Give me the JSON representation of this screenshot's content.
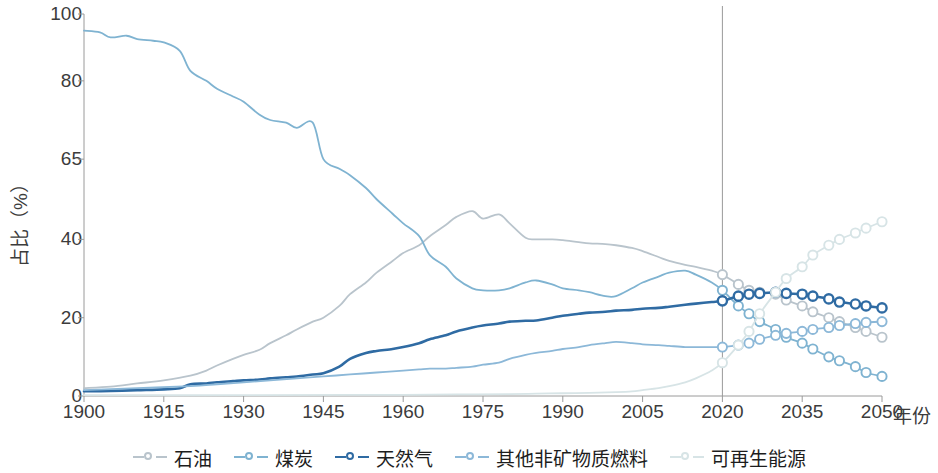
{
  "chart_data": {
    "type": "line",
    "title": "",
    "xlabel": "年份",
    "ylabel": "占比（%）",
    "xlim": [
      1900,
      2050
    ],
    "ylim": [
      0,
      100
    ],
    "grid": false,
    "legend_position": "bottom",
    "yticks": [
      0,
      20,
      40,
      65,
      80,
      100
    ],
    "ytick_positions_frac": [
      0.0,
      0.205,
      0.41,
      0.62,
      0.825,
      1.0
    ],
    "xticks": [
      1900,
      1915,
      1930,
      1945,
      1960,
      1975,
      1990,
      2005,
      2020,
      2035,
      2050
    ],
    "projection_divider_year": 2020,
    "colors": {
      "oil": "#b9c4cc",
      "coal": "#7fb3d1",
      "gas": "#2f6ba3",
      "other_nonfossil": "#8cb8d8",
      "renewables": "#d7e4e6",
      "axis": "#9a9a9a",
      "divider": "#9a9a9a",
      "text": "#3c3c3c"
    },
    "series": [
      {
        "name": "石油",
        "key": "oil",
        "color": "#b9c4cc",
        "markers_from_year": 2020,
        "x": [
          1900,
          1905,
          1910,
          1915,
          1920,
          1923,
          1925,
          1928,
          1930,
          1933,
          1935,
          1938,
          1940,
          1943,
          1945,
          1948,
          1950,
          1953,
          1955,
          1958,
          1960,
          1963,
          1965,
          1968,
          1970,
          1973,
          1975,
          1978,
          1980,
          1983,
          1985,
          1988,
          1990,
          1993,
          1995,
          1998,
          2000,
          2003,
          2005,
          2008,
          2010,
          2013,
          2015,
          2018,
          2020,
          2023,
          2025,
          2027,
          2030,
          2032,
          2035,
          2037,
          2040,
          2042,
          2045,
          2047,
          2050
        ],
        "y": [
          2.0,
          2.4,
          3.2,
          4.0,
          5.2,
          6.5,
          7.8,
          9.5,
          10.5,
          11.8,
          13.5,
          15.5,
          17.0,
          19.0,
          20.0,
          23.0,
          26.0,
          29.0,
          31.5,
          34.5,
          36.5,
          38.5,
          41.0,
          44.5,
          47.0,
          48.8,
          46.5,
          47.8,
          45.0,
          40.5,
          40.0,
          40.0,
          39.8,
          39.3,
          39.0,
          38.8,
          38.5,
          37.8,
          37.0,
          35.5,
          34.5,
          33.5,
          33.0,
          32.0,
          31.0,
          28.5,
          27.0,
          26.5,
          26.0,
          24.5,
          23.0,
          21.5,
          20.0,
          19.0,
          17.5,
          16.5,
          15.0
        ]
      },
      {
        "name": "煤炭",
        "key": "coal",
        "color": "#7fb3d1",
        "markers_from_year": 2020,
        "x": [
          1900,
          1903,
          1905,
          1908,
          1910,
          1913,
          1915,
          1918,
          1920,
          1923,
          1925,
          1928,
          1930,
          1933,
          1935,
          1938,
          1940,
          1943,
          1945,
          1948,
          1950,
          1953,
          1955,
          1958,
          1960,
          1963,
          1965,
          1968,
          1970,
          1973,
          1975,
          1978,
          1980,
          1983,
          1985,
          1988,
          1990,
          1993,
          1995,
          1998,
          2000,
          2003,
          2005,
          2008,
          2010,
          2013,
          2015,
          2018,
          2020,
          2023,
          2025,
          2027,
          2030,
          2032,
          2035,
          2037,
          2040,
          2042,
          2045,
          2047,
          2050
        ],
        "y": [
          95.0,
          94.5,
          93.0,
          93.5,
          92.5,
          92.0,
          91.5,
          89.0,
          83.0,
          80.0,
          78.5,
          77.0,
          76.0,
          73.5,
          72.5,
          72.0,
          71.0,
          72.0,
          65.0,
          62.0,
          60.0,
          56.0,
          52.5,
          48.0,
          45.0,
          41.0,
          36.0,
          33.0,
          30.0,
          27.5,
          27.0,
          27.0,
          27.5,
          29.0,
          29.5,
          28.5,
          27.5,
          27.0,
          26.5,
          25.5,
          25.5,
          27.5,
          29.0,
          30.5,
          31.5,
          32.0,
          31.0,
          29.0,
          27.0,
          23.0,
          21.0,
          19.0,
          17.0,
          15.0,
          13.5,
          12.0,
          10.0,
          9.0,
          7.5,
          6.0,
          5.0
        ]
      },
      {
        "name": "天然气",
        "key": "gas",
        "color": "#2f6ba3",
        "markers_from_year": 2020,
        "x": [
          1900,
          1905,
          1910,
          1915,
          1918,
          1920,
          1923,
          1925,
          1928,
          1930,
          1933,
          1935,
          1938,
          1940,
          1943,
          1945,
          1948,
          1950,
          1953,
          1955,
          1958,
          1960,
          1963,
          1965,
          1968,
          1970,
          1973,
          1975,
          1978,
          1980,
          1983,
          1985,
          1988,
          1990,
          1993,
          1995,
          1998,
          2000,
          2003,
          2005,
          2008,
          2010,
          2013,
          2015,
          2018,
          2020,
          2023,
          2025,
          2027,
          2030,
          2032,
          2035,
          2037,
          2040,
          2042,
          2045,
          2047,
          2050
        ],
        "y": [
          1.2,
          1.3,
          1.5,
          1.7,
          2.0,
          3.0,
          3.2,
          3.5,
          3.8,
          4.0,
          4.2,
          4.5,
          4.8,
          5.0,
          5.5,
          5.8,
          7.5,
          9.5,
          11.0,
          11.5,
          12.0,
          12.5,
          13.5,
          14.5,
          15.5,
          16.5,
          17.5,
          18.0,
          18.5,
          19.0,
          19.2,
          19.3,
          20.0,
          20.5,
          21.0,
          21.3,
          21.5,
          21.8,
          22.0,
          22.3,
          22.5,
          22.8,
          23.3,
          23.6,
          24.0,
          24.3,
          25.5,
          26.0,
          26.2,
          26.5,
          26.2,
          26.0,
          25.5,
          24.8,
          24.0,
          23.5,
          23.0,
          22.5
        ]
      },
      {
        "name": "其他非矿物质燃料",
        "key": "other_nonfossil",
        "color": "#8cb8d8",
        "markers_from_year": 2020,
        "x": [
          1900,
          1910,
          1920,
          1925,
          1930,
          1935,
          1940,
          1945,
          1950,
          1955,
          1960,
          1963,
          1965,
          1968,
          1970,
          1973,
          1975,
          1978,
          1980,
          1983,
          1985,
          1988,
          1990,
          1993,
          1995,
          1998,
          2000,
          2003,
          2005,
          2008,
          2010,
          2013,
          2015,
          2018,
          2020,
          2023,
          2025,
          2027,
          2030,
          2032,
          2035,
          2037,
          2040,
          2042,
          2045,
          2047,
          2050
        ],
        "y": [
          1.5,
          2.0,
          2.5,
          3.0,
          3.5,
          4.0,
          4.5,
          5.0,
          5.5,
          6.0,
          6.5,
          6.8,
          7.0,
          7.0,
          7.2,
          7.5,
          8.0,
          8.5,
          9.5,
          10.5,
          11.0,
          11.5,
          12.0,
          12.5,
          13.0,
          13.5,
          13.8,
          13.5,
          13.2,
          13.0,
          12.8,
          12.5,
          12.5,
          12.5,
          12.5,
          13.0,
          13.5,
          14.5,
          15.5,
          16.0,
          16.5,
          17.0,
          17.5,
          18.0,
          18.5,
          18.8,
          19.0
        ]
      },
      {
        "name": "可再生能源",
        "key": "renewables",
        "color": "#d7e4e6",
        "markers_from_year": 2020,
        "x": [
          1900,
          1930,
          1950,
          1960,
          1970,
          1980,
          1985,
          1990,
          1995,
          2000,
          2003,
          2005,
          2008,
          2010,
          2013,
          2015,
          2018,
          2020,
          2023,
          2025,
          2027,
          2030,
          2032,
          2035,
          2037,
          2040,
          2042,
          2045,
          2047,
          2050
        ],
        "y": [
          0.2,
          0.2,
          0.3,
          0.3,
          0.4,
          0.5,
          0.6,
          0.7,
          0.8,
          1.0,
          1.2,
          1.5,
          2.0,
          2.5,
          3.5,
          4.5,
          6.5,
          8.5,
          13.0,
          16.5,
          21.0,
          26.5,
          30.0,
          33.0,
          36.0,
          38.5,
          40.0,
          42.0,
          43.5,
          45.5
        ]
      }
    ]
  },
  "axes": {
    "ytick_labels": [
      "0",
      "20",
      "40",
      "65",
      "80",
      "100"
    ],
    "xtick_labels": [
      "1900",
      "1915",
      "1930",
      "1945",
      "1960",
      "1975",
      "1990",
      "2005",
      "2020",
      "2035",
      "2050"
    ],
    "x_axis_title": "年份",
    "y_axis_title": "占比（%）"
  },
  "legend": {
    "items": [
      {
        "label": "石油",
        "key": "oil",
        "color": "#b9c4cc"
      },
      {
        "label": "煤炭",
        "key": "coal",
        "color": "#7fb3d1"
      },
      {
        "label": "天然气",
        "key": "gas",
        "color": "#2f6ba3"
      },
      {
        "label": "其他非矿物质燃料",
        "key": "other_nonfossil",
        "color": "#8cb8d8"
      },
      {
        "label": "可再生能源",
        "key": "renewables",
        "color": "#d7e4e6"
      }
    ]
  }
}
